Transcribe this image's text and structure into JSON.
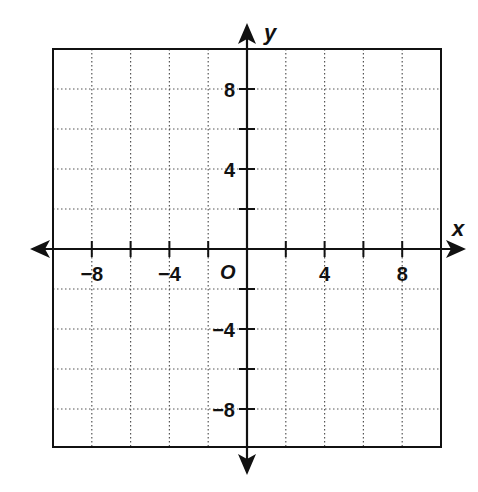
{
  "chart_data": {
    "type": "coordinate-plane",
    "title": "",
    "xlabel": "x",
    "ylabel": "y",
    "origin_label": "O",
    "xlim": [
      -10,
      10
    ],
    "ylim": [
      -10,
      10
    ],
    "grid": true,
    "grid_style": "dotted",
    "grid_step": 2,
    "tick_step": 2,
    "x_tick_labels": [
      {
        "value": -8,
        "label": "−8"
      },
      {
        "value": -4,
        "label": "−4"
      },
      {
        "value": 4,
        "label": "4"
      },
      {
        "value": 8,
        "label": "8"
      }
    ],
    "y_tick_labels": [
      {
        "value": 8,
        "label": "8"
      },
      {
        "value": 4,
        "label": "4"
      },
      {
        "value": -4,
        "label": "−4"
      },
      {
        "value": -8,
        "label": "−8"
      }
    ],
    "arrows": "both ends on both axes",
    "points": [],
    "series": []
  },
  "colors": {
    "background": "#ffffff",
    "ink": "#111111",
    "grid": "#555555"
  }
}
